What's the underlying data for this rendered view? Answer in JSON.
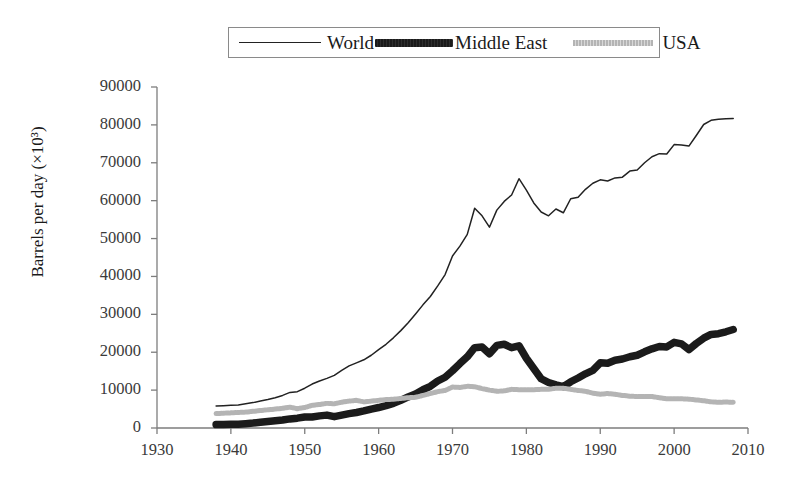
{
  "legend": {
    "items": [
      {
        "label": "World",
        "style": "thin-solid-line",
        "color": "#222222"
      },
      {
        "label": "Middle East",
        "style": "thick-dark-line",
        "color": "#1b1b1b"
      },
      {
        "label": "USA",
        "style": "light-dotted-line",
        "color": "#b4b4b4"
      }
    ]
  },
  "axes": {
    "ylabel": "Barrels per day (×10³)",
    "xlabel": "",
    "yticks": [
      "90000",
      "80000",
      "70000",
      "60000",
      "50000",
      "40000",
      "30000",
      "20000",
      "10000",
      "0"
    ],
    "xticks": [
      "1930",
      "1940",
      "1950",
      "1960",
      "1970",
      "1980",
      "1990",
      "2000",
      "2010"
    ]
  },
  "chart_data": {
    "type": "line",
    "title": "",
    "xlabel": "",
    "ylabel": "Barrels per day (×10³)",
    "xlim": [
      1930,
      2010
    ],
    "ylim": [
      0,
      90000
    ],
    "xtick_step": 10,
    "ytick_step": 10000,
    "grid": false,
    "legend_position": "top-center",
    "x": [
      1938,
      1939,
      1940,
      1941,
      1942,
      1943,
      1944,
      1945,
      1946,
      1947,
      1948,
      1949,
      1950,
      1951,
      1952,
      1953,
      1954,
      1955,
      1956,
      1957,
      1958,
      1959,
      1960,
      1961,
      1962,
      1963,
      1964,
      1965,
      1966,
      1967,
      1968,
      1969,
      1970,
      1971,
      1972,
      1973,
      1974,
      1975,
      1976,
      1977,
      1978,
      1979,
      1980,
      1981,
      1982,
      1983,
      1984,
      1985,
      1986,
      1987,
      1988,
      1989,
      1990,
      1991,
      1992,
      1993,
      1994,
      1995,
      1996,
      1997,
      1998,
      1999,
      2000,
      2001,
      2002,
      2003,
      2004,
      2005,
      2006,
      2007,
      2008
    ],
    "series": [
      {
        "name": "World",
        "color": "#222222",
        "style": "thin-solid-line",
        "values": [
          5800,
          5900,
          6000,
          6100,
          6400,
          6700,
          7100,
          7500,
          8000,
          8600,
          9400,
          9600,
          10500,
          11600,
          12400,
          13100,
          13900,
          15200,
          16400,
          17200,
          18000,
          19200,
          20700,
          22100,
          23800,
          25700,
          27800,
          30100,
          32500,
          34700,
          37500,
          40500,
          45400,
          48000,
          51100,
          58000,
          56000,
          53000,
          57500,
          59800,
          61500,
          65800,
          62800,
          59400,
          57000,
          56000,
          57800,
          56800,
          60500,
          60900,
          63000,
          64600,
          65500,
          65200,
          66000,
          66200,
          67800,
          68100,
          70000,
          71600,
          72400,
          72300,
          74800,
          74700,
          74400,
          77200,
          80100,
          81200,
          81500,
          81600,
          81700
        ]
      },
      {
        "name": "Middle East",
        "color": "#1b1b1b",
        "style": "thick-dark-line",
        "values": [
          900,
          950,
          980,
          1020,
          1150,
          1300,
          1500,
          1700,
          1900,
          2100,
          2400,
          2600,
          2900,
          2900,
          3200,
          3400,
          3000,
          3400,
          3800,
          4100,
          4500,
          5000,
          5400,
          5900,
          6500,
          7300,
          8200,
          9000,
          10100,
          11000,
          12400,
          13400,
          15100,
          17000,
          18800,
          21200,
          21400,
          19600,
          21800,
          22100,
          21200,
          21700,
          18400,
          15700,
          13000,
          12000,
          11400,
          10900,
          12200,
          13200,
          14300,
          15200,
          17200,
          17100,
          17900,
          18200,
          18800,
          19200,
          20100,
          20900,
          21500,
          21400,
          22600,
          22200,
          20700,
          22300,
          23700,
          24700,
          24900,
          25400,
          26000
        ]
      },
      {
        "name": "USA",
        "color": "#b4b4b4",
        "style": "light-dotted-line",
        "values": [
          3800,
          3900,
          4000,
          4100,
          4200,
          4400,
          4600,
          4800,
          5000,
          5200,
          5500,
          5100,
          5400,
          6000,
          6200,
          6500,
          6400,
          6800,
          7100,
          7300,
          6900,
          7100,
          7300,
          7500,
          7600,
          7800,
          8000,
          8100,
          8600,
          9100,
          9600,
          9900,
          10800,
          10700,
          11000,
          10900,
          10400,
          10000,
          9700,
          9800,
          10200,
          10100,
          10100,
          10100,
          10200,
          10200,
          10500,
          10500,
          10200,
          9900,
          9700,
          9200,
          8900,
          9100,
          8900,
          8600,
          8400,
          8300,
          8300,
          8300,
          8000,
          7700,
          7700,
          7700,
          7600,
          7400,
          7200,
          6900,
          6800,
          6850,
          6800
        ]
      }
    ]
  }
}
